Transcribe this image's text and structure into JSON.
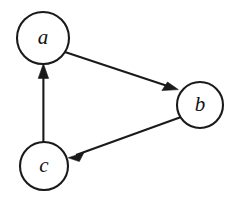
{
  "figure": {
    "kind": "directed-graph-diagram",
    "background_color": "#ffffff",
    "stroke_color": "#1a1a1a",
    "label_color": "#111111",
    "width": 232,
    "height": 200
  },
  "graph": {
    "type": "directed",
    "nodes": [
      {
        "id": "a",
        "label": "a",
        "cx": 43,
        "cy": 38,
        "r": 26
      },
      {
        "id": "b",
        "label": "b",
        "cx": 200,
        "cy": 105,
        "r": 23
      },
      {
        "id": "c",
        "label": "c",
        "cx": 44,
        "cy": 166,
        "r": 24
      }
    ],
    "edges": [
      {
        "id": "a-to-b",
        "from": "a",
        "to": "b",
        "label": "",
        "arrowhead": "filled-triangle"
      },
      {
        "id": "b-to-c",
        "from": "b",
        "to": "c",
        "label": "",
        "arrowhead": "filled-triangle"
      },
      {
        "id": "c-to-a",
        "from": "c",
        "to": "a",
        "label": "",
        "arrowhead": "filled-triangle"
      }
    ]
  }
}
